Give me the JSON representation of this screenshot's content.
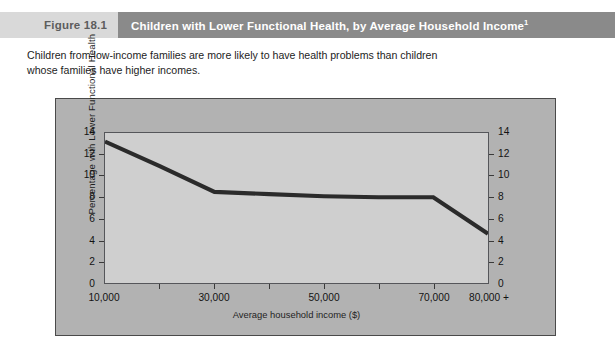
{
  "figure": {
    "number": "Figure 18.1",
    "title": "Children with Lower Functional Health, by Average Household Income",
    "title_superscript": "1",
    "caption": "Children from low-income families are more likely to have health problems than children whose families have higher incomes."
  },
  "colors": {
    "header_band": "#8a8a8a",
    "figure_number_band": "#d9d9d9",
    "chart_panel": "#b2b2b2",
    "plot_background": "#cfcfcf",
    "line": "#2b2b2b",
    "frame_border": "#4a4a4a"
  },
  "chart_data": {
    "type": "line",
    "title": "Children with Lower Functional Health, by Average Household Income",
    "xlabel": "Average household income ($)",
    "ylabel": "Percentage  with Lower  Functional Health",
    "x": [
      10000,
      20000,
      30000,
      40000,
      50000,
      60000,
      70000,
      80000
    ],
    "x_tick_labels": [
      "10,000",
      "",
      "30,000",
      "",
      "50,000",
      "",
      "70,000",
      "80,000 +"
    ],
    "x_major_tick_labels": [
      "10,000",
      "30,000",
      "50,000",
      "70,000",
      "80,000 +"
    ],
    "values": [
      13.2,
      10.9,
      8.5,
      8.3,
      8.1,
      8.0,
      8.0,
      4.6
    ],
    "series": [
      {
        "name": "Percentage with lower functional health",
        "values": [
          13.2,
          10.9,
          8.5,
          8.3,
          8.1,
          8.0,
          8.0,
          4.6
        ]
      }
    ],
    "ylim": [
      0,
      14
    ],
    "y_ticks": [
      0,
      2,
      4,
      6,
      8,
      10,
      12,
      14
    ],
    "y_tick_labels": [
      "0",
      "2",
      "4",
      "6",
      "8",
      "10",
      "12",
      "14"
    ],
    "y_axis_right_labels": [
      "0",
      "2",
      "4",
      "6",
      "8",
      "10",
      "12",
      "14"
    ],
    "xlim": [
      10000,
      80000
    ],
    "grid": false,
    "legend": "none",
    "dual_y_axis": true
  }
}
